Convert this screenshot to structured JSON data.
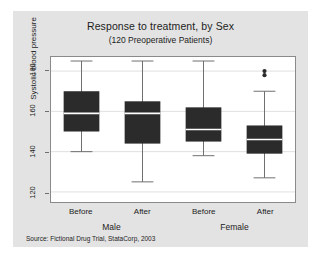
{
  "chart_data": {
    "type": "box",
    "title": "Response to treatment, by Sex",
    "subtitle": "(120 Preoperative Patients)",
    "ylabel": "Systolic blood pressure",
    "xlabel": "",
    "ylim": [
      115,
      187
    ],
    "yticks": [
      120,
      140,
      160,
      180
    ],
    "ytick_labels": [
      "120",
      "140",
      "160",
      "180"
    ],
    "grid": true,
    "grid_axis": "y",
    "legend": false,
    "source": "Source: Fictional Drug Trial, StataCorp, 2003",
    "group_labels": [
      "Male",
      "Female"
    ],
    "categories": [
      "Before",
      "After",
      "Before",
      "After"
    ],
    "box_color": "#2b2b2b",
    "median_color": "#ffffff",
    "whisker_color": "#6e6e6e",
    "frame_color": "#8a8a8a",
    "grid_color": "#e0e0e0",
    "boxes": [
      {
        "group": "Male",
        "label": "Before",
        "whisker_low": 140,
        "q1": 150,
        "median": 159,
        "q3": 170,
        "whisker_high": 185,
        "outliers": []
      },
      {
        "group": "Male",
        "label": "After",
        "whisker_low": 125,
        "q1": 144,
        "median": 159,
        "q3": 165,
        "whisker_high": 185,
        "outliers": []
      },
      {
        "group": "Female",
        "label": "Before",
        "whisker_low": 138,
        "q1": 145,
        "median": 151,
        "q3": 162,
        "whisker_high": 185,
        "outliers": []
      },
      {
        "group": "Female",
        "label": "After",
        "whisker_low": 127,
        "q1": 139,
        "median": 146,
        "q3": 153,
        "whisker_high": 170,
        "outliers": [
          178,
          180
        ]
      }
    ]
  }
}
